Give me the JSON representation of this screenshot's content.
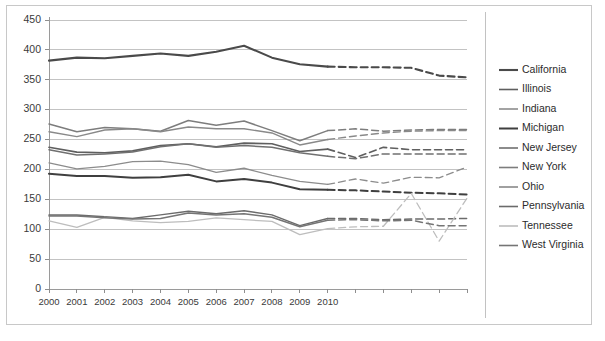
{
  "chart_data": {
    "type": "line",
    "title": "",
    "subtitle": "",
    "xlabel": "",
    "ylabel": "",
    "ylim": [
      0,
      450
    ],
    "ytick_step": 50,
    "ytick_labels": [
      "0",
      "50",
      "100",
      "150",
      "200",
      "250",
      "300",
      "350",
      "400",
      "450"
    ],
    "grid": true,
    "legend_position": "right",
    "x": [
      2000,
      2001,
      2002,
      2003,
      2004,
      2005,
      2006,
      2007,
      2008,
      2009,
      2010,
      2011,
      2012,
      2013,
      2014,
      2015
    ],
    "xtick_labels": [
      "2000",
      "2001",
      "2002",
      "2003",
      "2004",
      "2005",
      "2006",
      "2007",
      "2008",
      "2009",
      "2010",
      "",
      "",
      "",
      "",
      ""
    ],
    "forecast_start_index": 10,
    "forecast_note": "dashed segments are projections after 2010",
    "series": [
      {
        "name": "California",
        "color": "#4a4a4a",
        "width": 2.1,
        "values": [
          382,
          387,
          386,
          390,
          394,
          390,
          397,
          407,
          387,
          376,
          372,
          371,
          371,
          370,
          357,
          354
        ]
      },
      {
        "name": "Illinois",
        "color": "#5f5f5f",
        "width": 1.6,
        "values": [
          237,
          229,
          228,
          231,
          240,
          243,
          238,
          244,
          243,
          230,
          234,
          220,
          237,
          233,
          233,
          233
        ]
      },
      {
        "name": "Indiana",
        "color": "#8c8c8c",
        "width": 1.3,
        "values": [
          211,
          201,
          205,
          213,
          214,
          208,
          195,
          202,
          190,
          180,
          175,
          184,
          177,
          187,
          186,
          204
        ]
      },
      {
        "name": "Michigan",
        "color": "#3f3f3f",
        "width": 2.0,
        "values": [
          193,
          189,
          189,
          186,
          187,
          191,
          180,
          184,
          178,
          167,
          166,
          165,
          163,
          161,
          160,
          158
        ]
      },
      {
        "name": "New Jersey",
        "color": "#707070",
        "width": 1.5,
        "values": [
          233,
          224,
          226,
          229,
          238,
          243,
          237,
          240,
          237,
          228,
          222,
          218,
          226,
          226,
          226,
          226
        ]
      },
      {
        "name": "New York",
        "color": "#7d7d7d",
        "width": 1.5,
        "values": [
          276,
          263,
          270,
          268,
          264,
          282,
          274,
          281,
          265,
          248,
          265,
          268,
          264,
          266,
          267,
          267
        ]
      },
      {
        "name": "Ohio",
        "color": "#898989",
        "width": 1.4,
        "values": [
          263,
          255,
          266,
          268,
          263,
          271,
          268,
          268,
          261,
          241,
          250,
          256,
          261,
          264,
          265,
          265
        ]
      },
      {
        "name": "Pennsylvania",
        "color": "#6b6b6b",
        "width": 1.5,
        "values": [
          124,
          124,
          121,
          118,
          124,
          130,
          126,
          131,
          124,
          106,
          118,
          118,
          116,
          117,
          117,
          118
        ]
      },
      {
        "name": "Tennessee",
        "color": "#bdbdbd",
        "width": 1.3,
        "values": [
          114,
          103,
          120,
          114,
          111,
          113,
          119,
          116,
          113,
          91,
          101,
          104,
          105,
          160,
          80,
          152
        ]
      },
      {
        "name": "West Virginia",
        "color": "#757575",
        "width": 1.5,
        "values": [
          122,
          122,
          119,
          117,
          118,
          127,
          124,
          126,
          120,
          104,
          115,
          116,
          114,
          115,
          106,
          106
        ]
      }
    ]
  },
  "legend": {
    "entries": [
      {
        "label": "California"
      },
      {
        "label": "Illinois"
      },
      {
        "label": "Indiana"
      },
      {
        "label": "Michigan"
      },
      {
        "label": "New Jersey"
      },
      {
        "label": "New York"
      },
      {
        "label": "Ohio"
      },
      {
        "label": "Pennsylvania"
      },
      {
        "label": "Tennessee"
      },
      {
        "label": "West Virginia"
      }
    ]
  }
}
